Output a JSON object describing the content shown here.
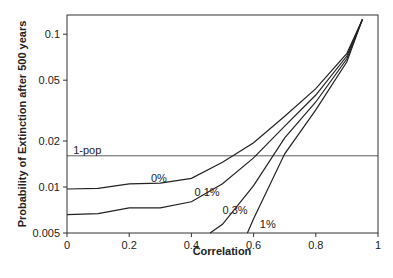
{
  "chart_data": {
    "type": "line",
    "title": "",
    "xlabel": "Correlation",
    "ylabel": "Probability of Extinction after 500 years",
    "xlim": [
      0,
      1
    ],
    "ylim": [
      0.005,
      0.13
    ],
    "yscale": "log",
    "grid": false,
    "legend": "inline labels",
    "x_ticks": [
      "0",
      "0.2",
      "0.4",
      "0.6",
      "0.8",
      "1"
    ],
    "y_ticks": [
      "0.005",
      "0.01",
      "0.02",
      "0.05",
      "0.1"
    ],
    "reference_line": {
      "label": "1-pop",
      "y": 0.016
    },
    "series": [
      {
        "name": "0%",
        "x": [
          0,
          0.1,
          0.2,
          0.3,
          0.4,
          0.5,
          0.6,
          0.7,
          0.8,
          0.9,
          0.95
        ],
        "values": [
          0.0097,
          0.0098,
          0.0105,
          0.0106,
          0.0114,
          0.0145,
          0.0195,
          0.029,
          0.044,
          0.075,
          0.13
        ]
      },
      {
        "name": "0.1%",
        "x": [
          0,
          0.1,
          0.2,
          0.3,
          0.4,
          0.5,
          0.6,
          0.7,
          0.8,
          0.9,
          0.95
        ],
        "values": [
          0.0066,
          0.0067,
          0.0073,
          0.0073,
          0.008,
          0.0105,
          0.0155,
          0.025,
          0.04,
          0.072,
          0.13
        ]
      },
      {
        "name": "0.3%",
        "x": [
          0.46,
          0.5,
          0.6,
          0.7,
          0.8,
          0.9,
          0.95
        ],
        "values": [
          0.005,
          0.0057,
          0.0102,
          0.021,
          0.036,
          0.069,
          0.13
        ]
      },
      {
        "name": "1%",
        "x": [
          0.58,
          0.6,
          0.7,
          0.8,
          0.9,
          0.95
        ],
        "values": [
          0.005,
          0.0062,
          0.0165,
          0.032,
          0.066,
          0.13
        ]
      }
    ],
    "annotations": [
      {
        "text": "1-pop",
        "x": 0.02,
        "y": 0.0165
      },
      {
        "text": "0%",
        "x": 0.27,
        "y": 0.0108
      },
      {
        "text": "0.1%",
        "x": 0.41,
        "y": 0.0087
      },
      {
        "text": "0.3%",
        "x": 0.5,
        "y": 0.0067
      },
      {
        "text": "1%",
        "x": 0.62,
        "y": 0.0054
      }
    ]
  }
}
